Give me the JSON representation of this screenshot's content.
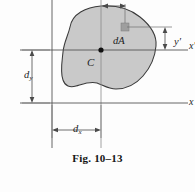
{
  "figure": {
    "caption": "Fig. 10–13",
    "centroid_label": "C",
    "element_label": "dA",
    "labels": {
      "y_prime": "y",
      "y_prime_mark": "′",
      "d_sub_y_main": "d",
      "d_sub_y_sub": "y",
      "d_sub_x_main": "d",
      "d_sub_x_sub": "x",
      "axis_x_prime_main": "x",
      "axis_x_prime_mark": "′",
      "axis_x": "x"
    },
    "colors": {
      "area_fill": "#c9c9c9",
      "area_stroke": "#3a3a3a",
      "axis_line": "#555555",
      "dimension_line": "#4a4a4a",
      "element_fill": "#9e9e9e",
      "centroid_dot": "#111111",
      "page_background": "#fdfdfd",
      "text": "#1d1d1d"
    },
    "geometry": {
      "centroid_x": 101,
      "centroid_y": 50,
      "element_x": 125,
      "element_y": 27,
      "x_axis_y": 103,
      "y_axis_x": 52,
      "d_x_value_px": 49,
      "d_y_value_px": 53
    }
  }
}
